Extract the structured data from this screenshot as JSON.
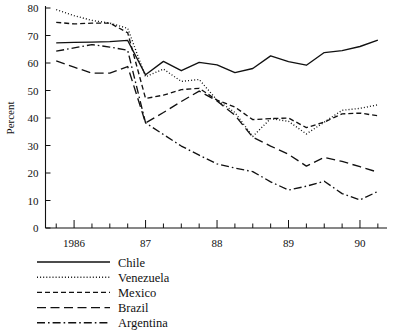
{
  "chart_data": {
    "type": "line",
    "title": "",
    "xlabel": "",
    "ylabel": "Percent",
    "ylim": [
      0,
      80
    ],
    "ytick_labels": [
      "0",
      "10",
      "20",
      "30",
      "40",
      "50",
      "60",
      "70",
      "80"
    ],
    "ytick_values": [
      0,
      10,
      20,
      30,
      40,
      50,
      60,
      70,
      80
    ],
    "xtick_labels": [
      "1986",
      "87",
      "88",
      "89",
      "90"
    ],
    "xtick_values": [
      1986,
      1987,
      1988,
      1989,
      1990
    ],
    "xlim": [
      1985.6,
      1990.35
    ],
    "x_minor_interval": 0.25,
    "grid": false,
    "legend_position": "below-left",
    "x": [
      1985.75,
      1986.0,
      1986.25,
      1986.5,
      1986.75,
      1987.0,
      1987.25,
      1987.5,
      1987.75,
      1988.0,
      1988.25,
      1988.5,
      1988.75,
      1989.0,
      1989.25,
      1989.5,
      1989.75,
      1990.0,
      1990.25
    ],
    "series": [
      {
        "name": "Chile",
        "style": "solid",
        "values": [
          67.3,
          67.5,
          67.6,
          67.8,
          68.2,
          55.7,
          60.6,
          57.2,
          60.2,
          59.3,
          56.5,
          58.0,
          62.6,
          60.5,
          59.2,
          63.8,
          64.5,
          66.0,
          68.3
        ]
      },
      {
        "name": "Venezuela",
        "style": "dotted",
        "values": [
          79.4,
          77.2,
          75.5,
          74.5,
          72.6,
          55.0,
          57.8,
          53.3,
          54.0,
          46.5,
          42.0,
          33.3,
          39.8,
          38.8,
          34.2,
          38.5,
          42.8,
          43.5,
          44.8
        ]
      },
      {
        "name": "Mexico",
        "style": "dashed-short",
        "values": [
          74.8,
          74.2,
          74.5,
          74.5,
          71.0,
          47.1,
          48.3,
          50.3,
          50.8,
          46.5,
          44.0,
          39.4,
          39.8,
          40.0,
          36.5,
          38.5,
          41.5,
          41.8,
          40.8
        ]
      },
      {
        "name": "Brazil",
        "style": "dashed-long",
        "values": [
          60.8,
          58.5,
          56.3,
          56.3,
          58.7,
          38.2,
          42.0,
          46.0,
          49.8,
          46.2,
          41.0,
          33.0,
          29.8,
          26.8,
          22.5,
          25.7,
          24.2,
          22.3,
          20.3
        ]
      },
      {
        "name": "Argentina",
        "style": "dash-dot",
        "values": [
          64.3,
          65.5,
          66.7,
          65.8,
          64.6,
          38.2,
          34.0,
          29.8,
          26.5,
          23.3,
          21.8,
          20.5,
          16.8,
          13.8,
          15.2,
          17.0,
          12.5,
          10.2,
          13.3
        ]
      }
    ]
  },
  "legend": {
    "items": [
      {
        "label": "Chile",
        "style": "solid"
      },
      {
        "label": "Venezuela",
        "style": "dotted"
      },
      {
        "label": "Mexico",
        "style": "dashed-short"
      },
      {
        "label": "Brazil",
        "style": "dashed-long"
      },
      {
        "label": "Argentina",
        "style": "dash-dot"
      }
    ]
  }
}
